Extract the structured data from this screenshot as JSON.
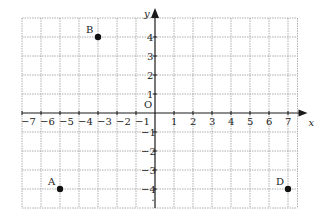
{
  "diagram": {
    "type": "coordinate-grid",
    "axes": {
      "x_label": "x",
      "y_label": "y",
      "origin_label": "O",
      "x_ticks": [
        -7,
        -6,
        -5,
        -4,
        -3,
        -2,
        -1,
        1,
        2,
        3,
        4,
        5,
        6,
        7
      ],
      "y_ticks": [
        4,
        3,
        2,
        1,
        -1,
        -2,
        -3,
        -4
      ],
      "x_range": [
        -7,
        7.5
      ],
      "y_range": [
        -5,
        5
      ]
    },
    "points": [
      {
        "label": "A",
        "x": -5,
        "y": -4
      },
      {
        "label": "B",
        "x": -3,
        "y": 4
      },
      {
        "label": "D",
        "x": 7,
        "y": -4
      }
    ],
    "colors": {
      "grid": "#9a9a9a",
      "axis": "#1a1a1a",
      "point": "#111111",
      "text": "#222222"
    }
  }
}
